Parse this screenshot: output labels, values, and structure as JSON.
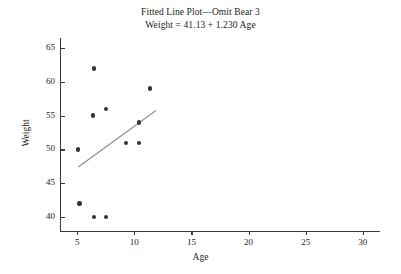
{
  "chart_data": {
    "type": "scatter",
    "title": "Fitted Line Plot—Omit Bear 3",
    "subtitle": "Weight = 41.13 + 1.230 Age",
    "xlabel": "Age",
    "ylabel": "Weight",
    "xlim": [
      3.5,
      31.5
    ],
    "ylim": [
      38.0,
      66.5
    ],
    "xticks": [
      5,
      10,
      15,
      20,
      25,
      30
    ],
    "yticks": [
      40,
      45,
      50,
      55,
      60,
      65
    ],
    "xtick_labels": [
      "5",
      "10",
      "15",
      "20",
      "25",
      "30"
    ],
    "ytick_labels": [
      "40",
      "45",
      "50",
      "55",
      "60",
      "65"
    ],
    "grid": false,
    "legend": false,
    "marker_color": "#333333",
    "line_color": "#8c8c8c",
    "axis_color": "#3b3b3b",
    "points": [
      {
        "x": 6.5,
        "y": 62.0
      },
      {
        "x": 11.4,
        "y": 59.0
      },
      {
        "x": 7.5,
        "y": 56.0
      },
      {
        "x": 6.4,
        "y": 55.0
      },
      {
        "x": 10.4,
        "y": 54.0
      },
      {
        "x": 5.1,
        "y": 50.0
      },
      {
        "x": 9.3,
        "y": 51.0
      },
      {
        "x": 10.4,
        "y": 51.0
      },
      {
        "x": 5.2,
        "y": 42.0
      },
      {
        "x": 6.5,
        "y": 40.0
      },
      {
        "x": 7.5,
        "y": 40.0
      }
    ],
    "fit_line": {
      "intercept": 41.13,
      "slope": 1.23,
      "x_start": 5.1,
      "x_end": 11.9
    }
  }
}
